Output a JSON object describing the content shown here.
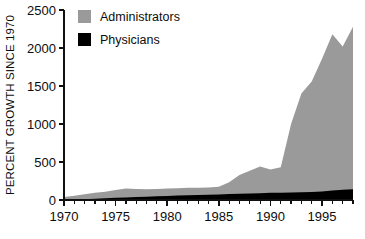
{
  "chart_data": {
    "type": "area",
    "stacked": true,
    "title": "",
    "subtitle": "",
    "xlabel": "",
    "ylabel": "PERCENT GROWTH SINCE 1970",
    "xlim": [
      1970,
      1998
    ],
    "ylim": [
      0,
      2500
    ],
    "y_ticks": [
      0,
      500,
      1000,
      1500,
      2000,
      2500
    ],
    "y_tick_labels": [
      "0",
      "500",
      "1000",
      "1500",
      "2000",
      "2500"
    ],
    "x_ticks_major": [
      1970,
      1975,
      1980,
      1985,
      1990,
      1995
    ],
    "x_tick_labels": [
      "1970",
      "1975",
      "1980",
      "1985",
      "1990",
      "1995"
    ],
    "x_ticks_minor_step": 1,
    "grid": false,
    "legend_position": "top-left-inside",
    "x": [
      1970,
      1971,
      1972,
      1973,
      1974,
      1975,
      1976,
      1977,
      1978,
      1979,
      1980,
      1981,
      1982,
      1983,
      1984,
      1985,
      1986,
      1987,
      1988,
      1989,
      1990,
      1991,
      1992,
      1993,
      1994,
      1995,
      1996,
      1997,
      1998
    ],
    "series": [
      {
        "name": "Physicians",
        "color": "#000000",
        "values": [
          0,
          5,
          11,
          17,
          23,
          29,
          34,
          39,
          44,
          49,
          54,
          58,
          62,
          66,
          70,
          74,
          78,
          82,
          86,
          90,
          94,
          97,
          100,
          103,
          106,
          112,
          125,
          136,
          140
        ]
      },
      {
        "name": "Administrators",
        "color": "#9a9a9a",
        "values": [
          40,
          55,
          75,
          95,
          110,
          130,
          150,
          145,
          142,
          145,
          150,
          155,
          160,
          162,
          165,
          175,
          235,
          330,
          385,
          440,
          400,
          430,
          1000,
          1400,
          1560,
          1860,
          2180,
          2020,
          2280
        ]
      }
    ],
    "legend": [
      {
        "label": "Administrators",
        "color": "#9a9a9a"
      },
      {
        "label": "Physicians",
        "color": "#000000"
      }
    ]
  }
}
